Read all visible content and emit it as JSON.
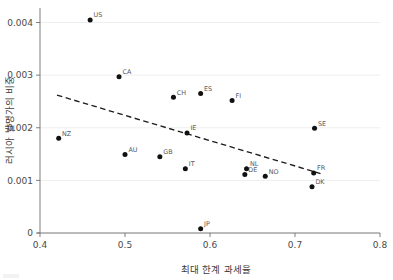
{
  "chart_data": {
    "type": "scatter",
    "title": "",
    "xlabel": "최대 한계 과세율",
    "ylabel": "러시아 발명가의 비중",
    "xlim": [
      0.4,
      0.8
    ],
    "ylim": [
      0,
      0.0042
    ],
    "xticks": [
      "0.4",
      "0.5",
      "0.6",
      "0.7",
      "0.8"
    ],
    "xtick_values": [
      0.4,
      0.5,
      0.6,
      0.7,
      0.8
    ],
    "yticks": [
      "0",
      "0.001",
      "0.002",
      "0.003",
      "0.004"
    ],
    "ytick_values": [
      0,
      0.001,
      0.002,
      0.003,
      0.004
    ],
    "grid": "horizontal",
    "legend": "none",
    "points": [
      {
        "label": "US",
        "x": 0.459,
        "y": 0.00405
      },
      {
        "label": "CA",
        "x": 0.493,
        "y": 0.00297
      },
      {
        "label": "CH",
        "x": 0.557,
        "y": 0.00258
      },
      {
        "label": "ES",
        "x": 0.589,
        "y": 0.00265
      },
      {
        "label": "FI",
        "x": 0.626,
        "y": 0.00252
      },
      {
        "label": "SE",
        "x": 0.723,
        "y": 0.00199
      },
      {
        "label": "IE",
        "x": 0.573,
        "y": 0.0019
      },
      {
        "label": "NZ",
        "x": 0.422,
        "y": 0.0018
      },
      {
        "label": "AU",
        "x": 0.5,
        "y": 0.00149
      },
      {
        "label": "GB",
        "x": 0.541,
        "y": 0.00145
      },
      {
        "label": "IT",
        "x": 0.571,
        "y": 0.00122
      },
      {
        "label": "NL",
        "x": 0.643,
        "y": 0.00122
      },
      {
        "label": "DE",
        "x": 0.641,
        "y": 0.00111
      },
      {
        "label": "NO",
        "x": 0.665,
        "y": 0.00108
      },
      {
        "label": "FR",
        "x": 0.722,
        "y": 0.00114
      },
      {
        "label": "DK",
        "x": 0.72,
        "y": 0.00088
      },
      {
        "label": "JP",
        "x": 0.589,
        "y": 8e-05
      }
    ],
    "trendline": {
      "type": "dashed-linear",
      "x_start": 0.42,
      "y_start": 0.00262,
      "x_end": 0.73,
      "y_end": 0.00113
    },
    "colors": {
      "point": "#111111",
      "trendline": "#1c1c1c",
      "gridline": "#ececec",
      "axis": "#6f6f6f",
      "text": "#3b3b3b",
      "background": "#ffffff"
    }
  }
}
